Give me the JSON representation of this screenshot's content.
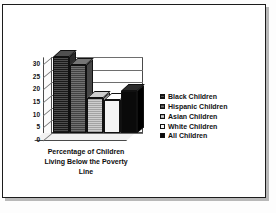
{
  "figure": {
    "frame_color": "#1c1c1c",
    "background": "#ffffff"
  },
  "chart_data": {
    "type": "bar",
    "title": "",
    "subtitle": "",
    "xlabel": "Percentage of Children Living Below the Poverty Line",
    "xlabel_lines": [
      "Percentage of Children",
      "Living Below the Poverty",
      "Line"
    ],
    "ylabel": "",
    "categories": [
      "Percentage of Children Living Below the Poverty Line"
    ],
    "ylim": [
      0,
      30
    ],
    "yticks": [
      30,
      25,
      20,
      15,
      10,
      5,
      0
    ],
    "ytick_labels": [
      "30",
      "25",
      "20",
      "15",
      "10",
      "5",
      "0"
    ],
    "grid": true,
    "legend_position": "right",
    "three_d": true,
    "series": [
      {
        "name": "Black Children",
        "values": [
          30
        ],
        "color": "#3a3a3a",
        "pattern": "dark-hatch"
      },
      {
        "name": "Hispanic Children",
        "values": [
          27
        ],
        "color": "#5e5e5e",
        "pattern": "gray-hatch"
      },
      {
        "name": "Asian Children",
        "values": [
          14
        ],
        "color": "#b9b9b9",
        "pattern": "light-hatch"
      },
      {
        "name": "White Children",
        "values": [
          13
        ],
        "color": "#f4f4f4",
        "pattern": "solid-white"
      },
      {
        "name": "All Children",
        "values": [
          16.5
        ],
        "color": "#0a0a0a",
        "pattern": "solid-black"
      }
    ]
  },
  "legend": {
    "items": [
      {
        "label": "Black Children"
      },
      {
        "label": "Hispanic Children"
      },
      {
        "label": "Asian Children"
      },
      {
        "label": "White Children"
      },
      {
        "label": "All Children"
      }
    ]
  }
}
